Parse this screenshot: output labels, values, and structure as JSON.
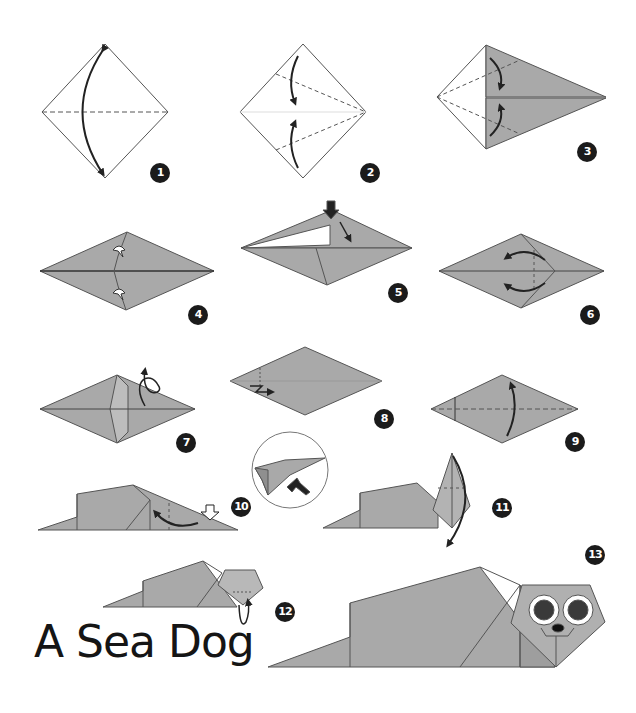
{
  "title": "A Sea Dog",
  "colors": {
    "paper": "#a9a9a9",
    "paper_dark": "#9a9a9a",
    "paper_light": "#bdbdbd",
    "line": "#4a4a4a",
    "badge": "#1b1b1b",
    "background": "#ffffff"
  },
  "steps": [
    {
      "number": "1",
      "action": "fold-and-unfold-diagonal"
    },
    {
      "number": "2",
      "action": "fold-edges-to-center"
    },
    {
      "number": "3",
      "action": "fold-edges-to-center"
    },
    {
      "number": "4",
      "action": "fold-behind"
    },
    {
      "number": "5",
      "action": "squash-fold"
    },
    {
      "number": "6",
      "action": "fold-and-unfold"
    },
    {
      "number": "7",
      "action": "turn-over"
    },
    {
      "number": "8",
      "action": "pleat-fold"
    },
    {
      "number": "9",
      "action": "fold-in-half"
    },
    {
      "number": "10",
      "action": "inside-reverse-fold",
      "detail": "zoomed-inset"
    },
    {
      "number": "11",
      "action": "outside-reverse-fold"
    },
    {
      "number": "12",
      "action": "tuck-nose"
    },
    {
      "number": "13",
      "action": "finished-sea-dog"
    }
  ]
}
